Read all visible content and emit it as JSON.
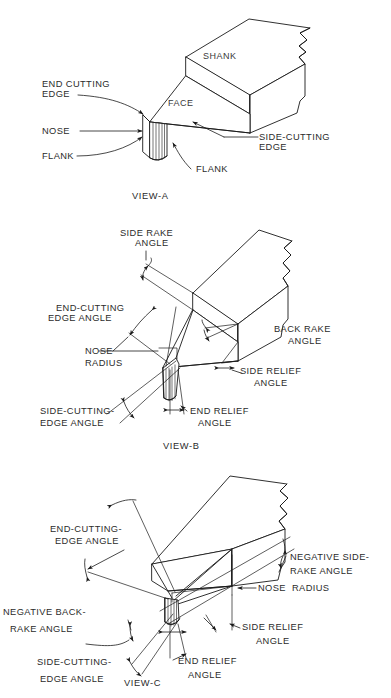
{
  "document": {
    "title": "Single-Point Cutting Tool Nomenclature",
    "background_color": "#ffffff",
    "line_color": "#1a1a1a",
    "text_color": "#2b2b2b"
  },
  "views": [
    {
      "id": "view-a",
      "caption": "VIEW-A",
      "description": "Isometric view of a single-point lathe tool identifying the principal tool surfaces and edges.",
      "labels": [
        {
          "key": "end_cutting_edge",
          "lines": [
            "END CUTTING",
            "EDGE"
          ]
        },
        {
          "key": "nose",
          "lines": [
            "NOSE"
          ]
        },
        {
          "key": "flank_left",
          "lines": [
            "FLANK"
          ]
        },
        {
          "key": "flank_right",
          "lines": [
            "FLANK"
          ]
        },
        {
          "key": "shank",
          "lines": [
            "SHANK"
          ]
        },
        {
          "key": "face",
          "lines": [
            "FACE"
          ]
        },
        {
          "key": "side_cutting_edge",
          "lines": [
            "SIDE-CUTTING",
            "EDGE"
          ]
        }
      ]
    },
    {
      "id": "view-b",
      "caption": "VIEW-B",
      "description": "Isometric view showing the positive-rake tool angles.",
      "labels": [
        {
          "key": "side_rake_angle",
          "lines": [
            "SIDE RAKE",
            "ANGLE"
          ]
        },
        {
          "key": "end_cutting_edge_angle",
          "lines": [
            "END-CUTTING",
            "EDGE ANGLE"
          ]
        },
        {
          "key": "nose_radius",
          "lines": [
            "NOSE",
            "RADIUS"
          ]
        },
        {
          "key": "side_cutting_edge_angle",
          "lines": [
            "SIDE-CUTTING-",
            "EDGE ANGLE"
          ]
        },
        {
          "key": "back_rake_angle",
          "lines": [
            "BACK RAKE",
            "ANGLE"
          ]
        },
        {
          "key": "side_relief_angle",
          "lines": [
            "SIDE RELIEF",
            "ANGLE"
          ]
        },
        {
          "key": "end_relief_angle",
          "lines": [
            "END RELIEF",
            "ANGLE"
          ]
        }
      ]
    },
    {
      "id": "view-c",
      "caption": "VIEW-C",
      "description": "Isometric view showing the negative-rake tool angles.",
      "labels": [
        {
          "key": "end_cutting_edge_angle",
          "lines": [
            "END-CUTTING-",
            "EDGE ANGLE"
          ]
        },
        {
          "key": "negative_back_rake_angle",
          "lines": [
            "NEGATIVE BACK-",
            "RAKE ANGLE"
          ]
        },
        {
          "key": "side_cutting_edge_angle",
          "lines": [
            "SIDE-CUTTING-",
            "EDGE ANGLE"
          ]
        },
        {
          "key": "negative_side_rake_angle",
          "lines": [
            "NEGATIVE SIDE-",
            "RAKE ANGLE"
          ]
        },
        {
          "key": "nose_radius",
          "lines": [
            "NOSE  RADIUS"
          ]
        },
        {
          "key": "side_relief_angle",
          "lines": [
            "SIDE RELIEF",
            "ANGLE"
          ]
        },
        {
          "key": "end_relief_angle",
          "lines": [
            "END RELIEF",
            "ANGLE"
          ]
        }
      ]
    }
  ],
  "text": {
    "view_a": {
      "caption": "VIEW-A",
      "end_cutting_edge_1": "END CUTTING",
      "end_cutting_edge_2": "EDGE",
      "nose": "NOSE",
      "flank_left": "FLANK",
      "flank_right": "FLANK",
      "shank": "SHANK",
      "face": "FACE",
      "side_cutting_edge_1": "SIDE-CUTTING",
      "side_cutting_edge_2": "EDGE"
    },
    "view_b": {
      "caption": "VIEW-B",
      "side_rake_1": "SIDE RAKE",
      "side_rake_2": "ANGLE",
      "end_cutting_edge_angle_1": "END-CUTTING",
      "end_cutting_edge_angle_2": "EDGE ANGLE",
      "nose_radius_1": "NOSE",
      "nose_radius_2": "RADIUS",
      "side_cutting_edge_angle_1": "SIDE-CUTTING-",
      "side_cutting_edge_angle_2": "EDGE ANGLE",
      "back_rake_1": "BACK RAKE",
      "back_rake_2": "ANGLE",
      "side_relief_1": "SIDE RELIEF",
      "side_relief_2": "ANGLE",
      "end_relief_1": "END RELIEF",
      "end_relief_2": "ANGLE"
    },
    "view_c": {
      "caption": "VIEW-C",
      "end_cutting_edge_angle_1": "END-CUTTING-",
      "end_cutting_edge_angle_2": "EDGE ANGLE",
      "negative_back_rake_1": "NEGATIVE BACK-",
      "negative_back_rake_2": "RAKE ANGLE",
      "side_cutting_edge_angle_1": "SIDE-CUTTING-",
      "side_cutting_edge_angle_2": "EDGE ANGLE",
      "negative_side_rake_1": "NEGATIVE SIDE-",
      "negative_side_rake_2": "RAKE ANGLE",
      "nose_radius": "NOSE  RADIUS",
      "side_relief_1": "SIDE RELIEF",
      "side_relief_2": "ANGLE",
      "end_relief_1": "END RELIEF",
      "end_relief_2": "ANGLE"
    }
  }
}
